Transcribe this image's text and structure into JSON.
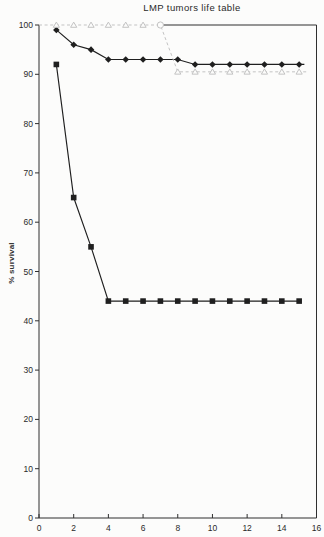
{
  "chart_data": {
    "type": "line",
    "title": "LMP tumors life table",
    "xlabel": "",
    "ylabel": "% survival",
    "xlim": [
      0,
      16
    ],
    "ylim": [
      0,
      100
    ],
    "x_ticks": [
      0,
      2,
      4,
      6,
      8,
      10,
      12,
      14,
      16
    ],
    "y_ticks": [
      0,
      10,
      20,
      30,
      40,
      50,
      60,
      70,
      80,
      90,
      100
    ],
    "grid": false,
    "legend": "none",
    "frame": {
      "box": true,
      "top_border_from_x": 7
    },
    "series": [
      {
        "name": "diamond-series",
        "marker": "filled-diamond",
        "line": "solid",
        "color": "#1f1f1f",
        "x": [
          1,
          2,
          3,
          4,
          5,
          6,
          7,
          8,
          9,
          10,
          11,
          12,
          13,
          14,
          15
        ],
        "y": [
          99,
          96,
          95,
          93,
          93,
          93,
          93,
          93,
          92,
          92,
          92,
          92,
          92,
          92,
          92
        ],
        "line_end_x": 15.3
      },
      {
        "name": "square-series",
        "marker": "filled-square",
        "line": "solid",
        "color": "#1f1f1f",
        "x": [
          1,
          2,
          3,
          4,
          5,
          6,
          7,
          8,
          9,
          10,
          11,
          12,
          13,
          14,
          15
        ],
        "y": [
          92,
          65,
          55,
          44,
          44,
          44,
          44,
          44,
          44,
          44,
          44,
          44,
          44,
          44,
          44
        ],
        "line_end_x": 15.1
      },
      {
        "name": "triangle-series",
        "marker": "open-triangle",
        "line": "dashed",
        "color": "#c3c3c3",
        "x": [
          0,
          1,
          2,
          3,
          4,
          5,
          6,
          7,
          8,
          9,
          10,
          11,
          12,
          13,
          14,
          15
        ],
        "y": [
          100,
          100,
          100,
          100,
          100,
          100,
          100,
          100,
          90.5,
          90.5,
          90.5,
          90.5,
          90.5,
          90.5,
          90.5,
          90.5
        ],
        "markers_from_index": 1,
        "marker_overrides": {
          "7": "open-circle"
        },
        "line_end_x": 15.55
      }
    ]
  },
  "colors": {
    "axis": "#2f2f2f",
    "dark_line": "#1f1f1f",
    "light_line": "#c3c3c3",
    "background": "#fcfcfb"
  }
}
